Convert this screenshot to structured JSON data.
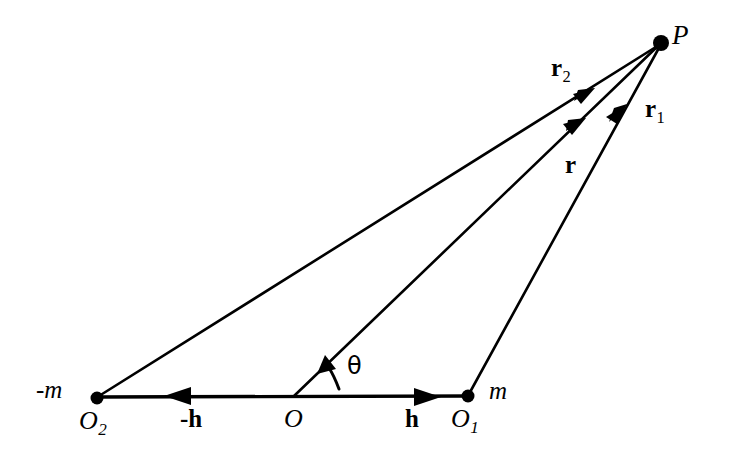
{
  "figure": {
    "background_color": "#ffffff",
    "stroke_color": "#000000",
    "width": 733,
    "height": 460
  },
  "points": {
    "P": {
      "label": "P",
      "x": 661,
      "y": 43,
      "marker": "filled-dot"
    },
    "O": {
      "label": "O",
      "x": 293,
      "y": 397,
      "marker": "none"
    },
    "O1": {
      "label": "O",
      "subscript": "1",
      "x": 468,
      "y": 396,
      "marker": "filled-dot"
    },
    "O2": {
      "label": "O",
      "subscript": "2",
      "x": 97,
      "y": 398,
      "marker": "filled-dot"
    }
  },
  "pole_labels": {
    "positive": "m",
    "negative": "-m"
  },
  "vectors": [
    {
      "name": "r2",
      "label": "r",
      "subscript": "2",
      "from": "O2",
      "to": "P",
      "style": "bold-upright",
      "arrow": "mid"
    },
    {
      "name": "r",
      "label": "r",
      "subscript": "",
      "from": "O",
      "to": "P",
      "style": "bold-upright",
      "arrow": "mid"
    },
    {
      "name": "r1",
      "label": "r",
      "subscript": "1",
      "from": "O1",
      "to": "P",
      "style": "bold-upright",
      "arrow": "mid"
    },
    {
      "name": "h",
      "label": "h",
      "subscript": "",
      "from": "O",
      "to": "O1",
      "style": "bold-upright",
      "arrow": "mid"
    },
    {
      "name": "-h",
      "label": "-h",
      "subscript": "",
      "from": "O",
      "to": "O2",
      "style": "bold-upright",
      "arrow": "mid"
    }
  ],
  "angle": {
    "symbol": "θ",
    "between": [
      "h-axis",
      "r"
    ],
    "vertex": "O"
  },
  "labels": {
    "P": "P",
    "r2_base": "r",
    "r2_sub": "2",
    "r1_base": "r",
    "r1_sub": "1",
    "r_base": "r",
    "theta": "θ",
    "neg_m": "-m",
    "O2_base": "O",
    "O2_sub": "2",
    "neg_h": "-h",
    "O": "O",
    "h": "h",
    "O1_base": "O",
    "O1_sub": "1",
    "m": "m"
  }
}
